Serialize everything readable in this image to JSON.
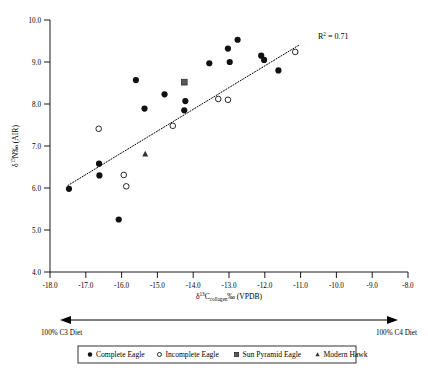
{
  "chart_data": {
    "type": "scatter",
    "title": "",
    "xlabel": "δ13Ccollagen ‰ (VPDB)",
    "xlabel_parts": {
      "delta": "δ",
      "sup": "13",
      "element": "C",
      "sub": "collagen",
      "tail": "‰ (VPDB)"
    },
    "ylabel": "δ15N ‰ (AIR)",
    "ylabel_parts": {
      "delta": "δ",
      "sup": "15",
      "element": "N",
      "tail": "‰ (AIR)"
    },
    "xlim": [
      -18.0,
      -8.0
    ],
    "ylim": [
      4.0,
      10.0
    ],
    "xticks": [
      "-18.0",
      "-17.0",
      "-16.0",
      "-15.0",
      "-14.0",
      "-13.0",
      "-12.0",
      "-11.0",
      "-10.0",
      "-9.0",
      "-8.0"
    ],
    "xtick_values": [
      -18.0,
      -17.0,
      -16.0,
      -15.0,
      -14.0,
      -13.0,
      -12.0,
      -11.0,
      -10.0,
      -9.0,
      -8.0
    ],
    "yticks": [
      "4.0",
      "5.0",
      "6.0",
      "7.0",
      "8.0",
      "9.0",
      "10.0"
    ],
    "ytick_values": [
      4.0,
      5.0,
      6.0,
      7.0,
      8.0,
      9.0,
      10.0
    ],
    "grid": false,
    "legend_position": "bottom",
    "annotations": [
      {
        "name": "r-squared",
        "text": "R2 = 0.71",
        "prefix": "R",
        "sup": "2",
        "suffix": " = 0.71",
        "x": -10.85,
        "y": 9.72
      }
    ],
    "trendline": {
      "name": "linear-fit",
      "style": "dotted",
      "x0": -17.5,
      "y0": 6.06,
      "x1": -11.05,
      "y1": 9.4,
      "r_squared": 0.71
    },
    "diet_axis": {
      "left_label": "100% C3 Diet",
      "right_label": "100% C4 Diet",
      "arrow": "double-headed"
    },
    "series": [
      {
        "name": "Complete Eagle",
        "marker": "filled-circle",
        "color": "#111111",
        "points": [
          [
            -17.47,
            5.98
          ],
          [
            -16.63,
            6.58
          ],
          [
            -16.62,
            6.3
          ],
          [
            -16.08,
            5.25
          ],
          [
            -15.6,
            8.57
          ],
          [
            -15.36,
            7.89
          ],
          [
            -14.8,
            8.23
          ],
          [
            -14.22,
            8.07
          ],
          [
            -14.25,
            7.85
          ],
          [
            -13.55,
            8.97
          ],
          [
            -13.03,
            9.32
          ],
          [
            -12.98,
            9.0
          ],
          [
            -12.76,
            9.53
          ],
          [
            -12.1,
            9.15
          ],
          [
            -12.02,
            9.05
          ],
          [
            -11.62,
            8.8
          ]
        ]
      },
      {
        "name": "Incomplete Eagle",
        "marker": "open-circle",
        "color": "#111111",
        "points": [
          [
            -16.64,
            7.41
          ],
          [
            -15.94,
            6.31
          ],
          [
            -15.87,
            6.04
          ],
          [
            -14.57,
            7.48
          ],
          [
            -13.3,
            8.12
          ],
          [
            -13.03,
            8.1
          ],
          [
            -11.15,
            9.24
          ]
        ]
      },
      {
        "name": "Sun Pyramid Eagle",
        "marker": "filled-square",
        "color": "#5a5a5a",
        "points": [
          [
            -14.25,
            8.52
          ]
        ]
      },
      {
        "name": "Modern Hawk",
        "marker": "filled-triangle",
        "color": "#333333",
        "points": [
          [
            -15.34,
            6.81
          ]
        ]
      }
    ],
    "legend": [
      {
        "label": "Complete Eagle",
        "marker": "filled-circle"
      },
      {
        "label": "Incomplete Eagle",
        "marker": "open-circle"
      },
      {
        "label": "Sun Pyramid Eagle",
        "marker": "filled-square"
      },
      {
        "label": "Modern Hawk",
        "marker": "filled-triangle"
      }
    ]
  }
}
